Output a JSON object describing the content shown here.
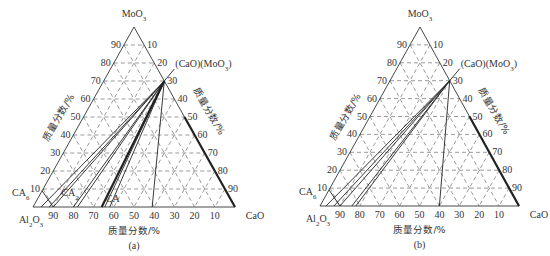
{
  "figures": [
    {
      "id": "a",
      "caption": "(a)",
      "vertices": {
        "top": "MoO3",
        "left": "Al2O3",
        "right": "CaO"
      },
      "compound_label": "(CaO)(MoO3)",
      "phase_labels": [
        "CA6",
        "CA2",
        "CA"
      ],
      "left_axis_title": "质量分数/%",
      "right_axis_title": "质量分数/%",
      "bottom_axis_title": "质量分数/%",
      "left_ticks": [
        "90",
        "80",
        "70",
        "60",
        "50",
        "40",
        "30",
        "20",
        "10"
      ],
      "right_ticks": [
        "10",
        "20",
        "30",
        "40",
        "50",
        "60",
        "70",
        "80",
        "90"
      ],
      "bottom_ticks": [
        "90",
        "80",
        "70",
        "60",
        "50",
        "40",
        "30",
        "20",
        "10"
      ]
    },
    {
      "id": "b",
      "caption": "(b)",
      "vertices": {
        "top": "MoO3",
        "left": "Al2O3",
        "right": "CaO"
      },
      "compound_label": "(CaO)(MoO3)",
      "phase_labels": [
        "CA6"
      ],
      "left_axis_title": "质量分数/%",
      "right_axis_title": "质量分数/%",
      "bottom_axis_title": "质量分数/%",
      "left_ticks": [
        "90",
        "80",
        "70",
        "60",
        "50",
        "40",
        "30",
        "20",
        "10"
      ],
      "right_ticks": [
        "10",
        "20",
        "30",
        "40",
        "50",
        "60",
        "70",
        "80",
        "90"
      ],
      "bottom_ticks": [
        "90",
        "80",
        "70",
        "60",
        "50",
        "40",
        "30",
        "20",
        "10"
      ]
    }
  ]
}
